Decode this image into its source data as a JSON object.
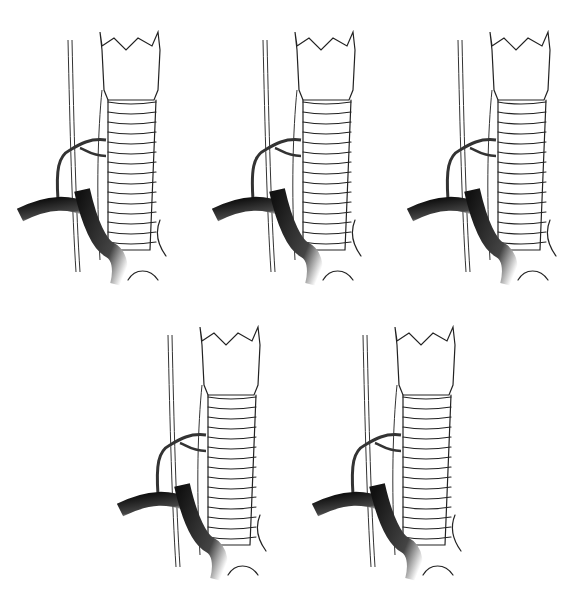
{
  "figure": {
    "panels": [
      {
        "id": "panel-1",
        "variant": "A",
        "x": 10,
        "y": 10
      },
      {
        "id": "panel-2",
        "variant": "B",
        "x": 205,
        "y": 10
      },
      {
        "id": "panel-3",
        "variant": "C",
        "x": 400,
        "y": 10
      },
      {
        "id": "panel-4",
        "variant": "D",
        "x": 110,
        "y": 305
      },
      {
        "id": "panel-5",
        "variant": "E",
        "x": 305,
        "y": 305
      }
    ],
    "colors": {
      "line": "#222222",
      "vessel": "#2b2b2b",
      "background": "#ffffff"
    }
  }
}
